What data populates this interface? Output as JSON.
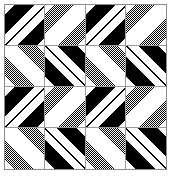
{
  "image": {
    "title": "Quilt block pattern swatch",
    "width": 173,
    "height": 177,
    "background_color": "#ffffff",
    "border_color": "#8a8a8a",
    "grid_line_color": "#9a9a9a",
    "plate": {
      "x": 4,
      "y": 4,
      "width": 163,
      "height": 166
    }
  },
  "palette": {
    "black": "#000000",
    "white": "#ffffff",
    "dither_gray": "#808080"
  },
  "pattern": {
    "name": "diagonal-chevron-quilt",
    "repeat": "2x2 blocks, each block 2x2 sub-tiles",
    "block_count": 4,
    "sub_tiles_per_block": 4,
    "stripe_angle_degrees": 45,
    "description": "Four identical quilt blocks arranged in a 2-by-2 grid. Each block contains four square sub-tiles of 45-degree stripes; the left column uses solid black-and-white bands and the right column uses dithered gray-and-white bands, producing nested chevron arrows pointing down-right.",
    "blocks": [
      {
        "id": "block-top-left",
        "label": "Top left block",
        "row": 0,
        "col": 0,
        "tiles": [
          {
            "id": "tl",
            "fill": "black-white",
            "orientation": "down-right"
          },
          {
            "id": "tr",
            "fill": "gray-white",
            "orientation": "down-right"
          },
          {
            "id": "bl",
            "fill": "gray-white",
            "orientation": "down-left"
          },
          {
            "id": "br",
            "fill": "black-white",
            "orientation": "down-left"
          }
        ]
      },
      {
        "id": "block-top-right",
        "label": "Top right block",
        "row": 0,
        "col": 1,
        "tiles": [
          {
            "id": "tl",
            "fill": "black-white",
            "orientation": "down-right"
          },
          {
            "id": "tr",
            "fill": "gray-white",
            "orientation": "down-right"
          },
          {
            "id": "bl",
            "fill": "gray-white",
            "orientation": "down-left"
          },
          {
            "id": "br",
            "fill": "black-white",
            "orientation": "down-left"
          }
        ]
      },
      {
        "id": "block-bottom-left",
        "label": "Bottom left block",
        "row": 1,
        "col": 0,
        "tiles": [
          {
            "id": "tl",
            "fill": "black-white",
            "orientation": "down-right"
          },
          {
            "id": "tr",
            "fill": "gray-white",
            "orientation": "down-right"
          },
          {
            "id": "bl",
            "fill": "gray-white",
            "orientation": "down-left"
          },
          {
            "id": "br",
            "fill": "black-white",
            "orientation": "down-left"
          }
        ]
      },
      {
        "id": "block-bottom-right",
        "label": "Bottom right block",
        "row": 1,
        "col": 1,
        "tiles": [
          {
            "id": "tl",
            "fill": "black-white",
            "orientation": "down-right"
          },
          {
            "id": "tr",
            "fill": "gray-white",
            "orientation": "down-right"
          },
          {
            "id": "bl",
            "fill": "gray-white",
            "orientation": "down-left"
          },
          {
            "id": "br",
            "fill": "black-white",
            "orientation": "down-left"
          }
        ]
      }
    ]
  }
}
